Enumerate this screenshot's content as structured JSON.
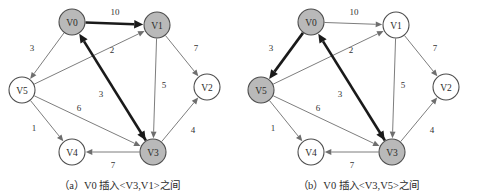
{
  "figure": {
    "panels": [
      {
        "id": "a",
        "caption": "（a）V0 插入<V3,V1>之间",
        "nodes": [
          {
            "id": "V0",
            "label": "V0",
            "cx": 72,
            "cy": 22,
            "r": 13,
            "fill": "gray"
          },
          {
            "id": "V1",
            "label": "V1",
            "cx": 157,
            "cy": 25,
            "r": 13,
            "fill": "gray"
          },
          {
            "id": "V2",
            "label": "V2",
            "cx": 207,
            "cy": 87,
            "r": 13,
            "fill": "white"
          },
          {
            "id": "V3",
            "label": "V3",
            "cx": 153,
            "cy": 152,
            "r": 13,
            "fill": "gray"
          },
          {
            "id": "V4",
            "label": "V4",
            "cx": 72,
            "cy": 152,
            "r": 13,
            "fill": "white"
          },
          {
            "id": "V5",
            "label": "V5",
            "cx": 22,
            "cy": 90,
            "r": 13,
            "fill": "white"
          }
        ],
        "edges": [
          {
            "from": "V0",
            "to": "V1",
            "weight": "10",
            "style": "bold",
            "lx": 115,
            "ly": 12
          },
          {
            "from": "V0",
            "to": "V5",
            "weight": "3",
            "style": "thin",
            "lx": 32,
            "ly": 48
          },
          {
            "from": "V5",
            "to": "V1",
            "weight": "2",
            "style": "thin",
            "lx": 112,
            "ly": 50
          },
          {
            "from": "V1",
            "to": "V2",
            "weight": "7",
            "style": "thin",
            "lx": 196,
            "ly": 48
          },
          {
            "from": "V1",
            "to": "V3",
            "weight": "5",
            "style": "thin",
            "lx": 164,
            "ly": 85
          },
          {
            "from": "V3",
            "to": "V0",
            "weight": "3",
            "style": "bold",
            "lx": 101,
            "ly": 94
          },
          {
            "from": "V5",
            "to": "V3",
            "weight": "6",
            "style": "thin",
            "lx": 79,
            "ly": 108
          },
          {
            "from": "V5",
            "to": "V4",
            "weight": "1",
            "style": "thin",
            "lx": 34,
            "ly": 128
          },
          {
            "from": "V3",
            "to": "V4",
            "weight": "7",
            "style": "thin",
            "lx": 113,
            "ly": 165
          },
          {
            "from": "V3",
            "to": "V2",
            "weight": "4",
            "style": "thin",
            "lx": 193,
            "ly": 130
          }
        ]
      },
      {
        "id": "b",
        "caption": "（b）V0 插入<V3,V5>之间",
        "nodes": [
          {
            "id": "V0",
            "label": "V0",
            "cx": 72,
            "cy": 22,
            "r": 13,
            "fill": "gray"
          },
          {
            "id": "V1",
            "label": "V1",
            "cx": 157,
            "cy": 25,
            "r": 13,
            "fill": "white"
          },
          {
            "id": "V2",
            "label": "V2",
            "cx": 207,
            "cy": 87,
            "r": 13,
            "fill": "white"
          },
          {
            "id": "V3",
            "label": "V3",
            "cx": 153,
            "cy": 152,
            "r": 13,
            "fill": "gray"
          },
          {
            "id": "V4",
            "label": "V4",
            "cx": 72,
            "cy": 152,
            "r": 13,
            "fill": "white"
          },
          {
            "id": "V5",
            "label": "V5",
            "cx": 22,
            "cy": 90,
            "r": 13,
            "fill": "gray"
          }
        ],
        "edges": [
          {
            "from": "V0",
            "to": "V1",
            "weight": "10",
            "style": "thin",
            "lx": 115,
            "ly": 12
          },
          {
            "from": "V0",
            "to": "V5",
            "weight": "3",
            "style": "bold",
            "lx": 32,
            "ly": 48
          },
          {
            "from": "V5",
            "to": "V1",
            "weight": "2",
            "style": "thin",
            "lx": 112,
            "ly": 50
          },
          {
            "from": "V1",
            "to": "V2",
            "weight": "7",
            "style": "thin",
            "lx": 196,
            "ly": 48
          },
          {
            "from": "V1",
            "to": "V3",
            "weight": "5",
            "style": "thin",
            "lx": 164,
            "ly": 85
          },
          {
            "from": "V3",
            "to": "V0",
            "weight": "3",
            "style": "bold",
            "lx": 101,
            "ly": 94
          },
          {
            "from": "V5",
            "to": "V3",
            "weight": "6",
            "style": "thin",
            "lx": 79,
            "ly": 108
          },
          {
            "from": "V5",
            "to": "V4",
            "weight": "1",
            "style": "thin",
            "lx": 34,
            "ly": 128
          },
          {
            "from": "V3",
            "to": "V4",
            "weight": "7",
            "style": "thin",
            "lx": 113,
            "ly": 165
          },
          {
            "from": "V3",
            "to": "V2",
            "weight": "4",
            "style": "thin",
            "lx": 193,
            "ly": 130
          }
        ]
      }
    ]
  }
}
